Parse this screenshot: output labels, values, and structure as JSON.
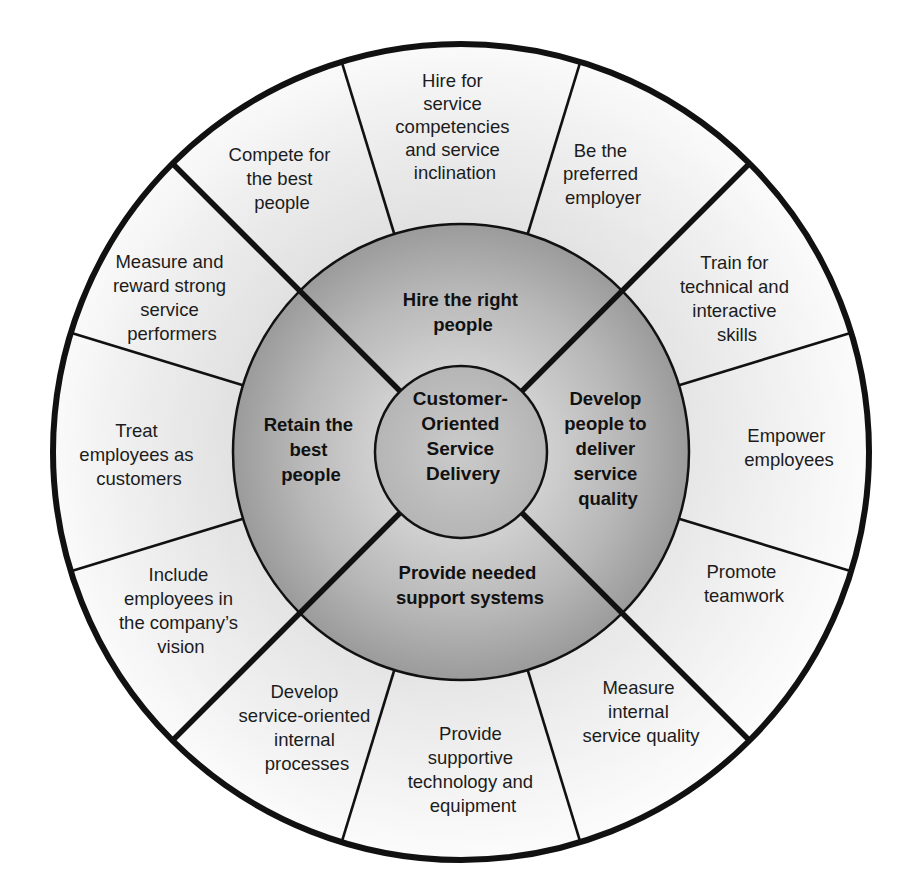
{
  "diagram": {
    "type": "concentric-wheel",
    "colors": {
      "outer_segment_light": "#f7f7f7",
      "outer_segment_mid": "#e6e6e6",
      "ring_light": "#cfcfcf",
      "ring_dark": "#9e9e9e",
      "core_fill": "#c4c4c4",
      "line": "#111111",
      "text": "#1c1c1c"
    },
    "core": {
      "lines": [
        "Customer-",
        "Oriented",
        "Service",
        "Delivery"
      ]
    },
    "ring": [
      {
        "id": "hire",
        "lines": [
          "Hire the right",
          "people"
        ]
      },
      {
        "id": "develop",
        "lines": [
          "Develop",
          "people to",
          "deliver",
          "service",
          "quality"
        ]
      },
      {
        "id": "support",
        "lines": [
          "Provide needed",
          "support systems"
        ]
      },
      {
        "id": "retain",
        "lines": [
          "Retain the",
          "best",
          "people"
        ]
      }
    ],
    "outer": [
      {
        "id": "hire-competencies",
        "quadrant": "hire",
        "lines": [
          "Hire for",
          "service",
          "competencies",
          "and service",
          "inclination"
        ]
      },
      {
        "id": "preferred-employer",
        "quadrant": "hire",
        "lines": [
          "Be the",
          "preferred",
          "employer"
        ]
      },
      {
        "id": "train",
        "quadrant": "develop",
        "lines": [
          "Train for",
          "technical and",
          "interactive",
          "skills"
        ]
      },
      {
        "id": "empower",
        "quadrant": "develop",
        "lines": [
          "Empower",
          "employees"
        ]
      },
      {
        "id": "teamwork",
        "quadrant": "develop",
        "lines": [
          "Promote",
          "teamwork"
        ]
      },
      {
        "id": "measure-internal",
        "quadrant": "support",
        "lines": [
          "Measure",
          "internal",
          "service quality"
        ]
      },
      {
        "id": "supportive-technology",
        "quadrant": "support",
        "lines": [
          "Provide",
          "supportive",
          "technology and",
          "equipment"
        ]
      },
      {
        "id": "internal-processes",
        "quadrant": "support",
        "lines": [
          "Develop",
          "service-oriented",
          "internal",
          "processes"
        ]
      },
      {
        "id": "include-vision",
        "quadrant": "retain",
        "lines": [
          "Include",
          "employees in",
          "the company’s",
          "vision"
        ]
      },
      {
        "id": "treat-customers",
        "quadrant": "retain",
        "lines": [
          "Treat",
          "employees as",
          "customers"
        ]
      },
      {
        "id": "measure-reward",
        "quadrant": "retain",
        "lines": [
          "Measure and",
          "reward strong",
          "service",
          "performers"
        ]
      },
      {
        "id": "compete",
        "quadrant": "hire",
        "lines": [
          "Compete for",
          "the best",
          "people"
        ]
      }
    ]
  }
}
